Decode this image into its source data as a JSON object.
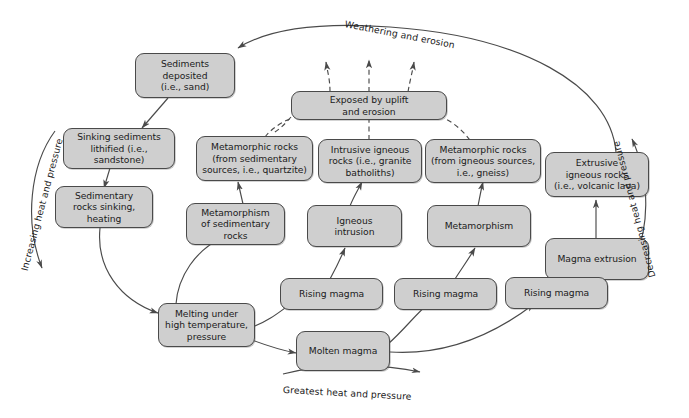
{
  "diagram": {
    "colors": {
      "node_fill": "#cfcfcf",
      "node_stroke": "#4a4a4a",
      "line": "#4a4a4a",
      "background": "#ffffff"
    },
    "nodes": [
      {
        "id": "sediments_deposited",
        "label": "Sediments\ndeposited\n(i.e., sand)"
      },
      {
        "id": "sinking_sediments",
        "label": "Sinking sediments\nlithified (i.e.,\nsandstone)"
      },
      {
        "id": "sedimentary_sinking",
        "label": "Sedimentary\nrocks sinking,\nheating"
      },
      {
        "id": "exposed_uplift",
        "label": "Exposed by uplift\nand erosion"
      },
      {
        "id": "metamorphic_sed",
        "label": "Metamorphic rocks\n(from sedimentary\nsources, i.e., quartzite)"
      },
      {
        "id": "intrusive_igneous",
        "label": "Intrusive igneous\nrocks (i.e., granite\nbatholiths)"
      },
      {
        "id": "metamorphic_ign",
        "label": "Metamorphic rocks\n(from igneous sources,\ni.e., gneiss)"
      },
      {
        "id": "extrusive_igneous",
        "label": "Extrusive\nigneous rocks\n(i.e., volcanic lava)"
      },
      {
        "id": "metamorphism_sed",
        "label": "Metamorphism\nof sedimentary\nrocks"
      },
      {
        "id": "igneous_intrusion",
        "label": "Igneous\nintrusion"
      },
      {
        "id": "metamorphism",
        "label": "Metamorphism"
      },
      {
        "id": "magma_extrusion",
        "label": "Magma extrusion"
      },
      {
        "id": "rising_magma_1",
        "label": "Rising magma"
      },
      {
        "id": "rising_magma_2",
        "label": "Rising magma"
      },
      {
        "id": "rising_magma_3",
        "label": "Rising magma"
      },
      {
        "id": "melting_under",
        "label": "Melting under\nhigh temperature,\npressure"
      },
      {
        "id": "molten_magma",
        "label": "Molten magma"
      }
    ],
    "arc_labels": {
      "top": "Weathering and erosion",
      "left": "Increasing heat and pressure",
      "right": "Decreasing heat and pressure",
      "bottom": "Greatest heat and pressure"
    }
  }
}
